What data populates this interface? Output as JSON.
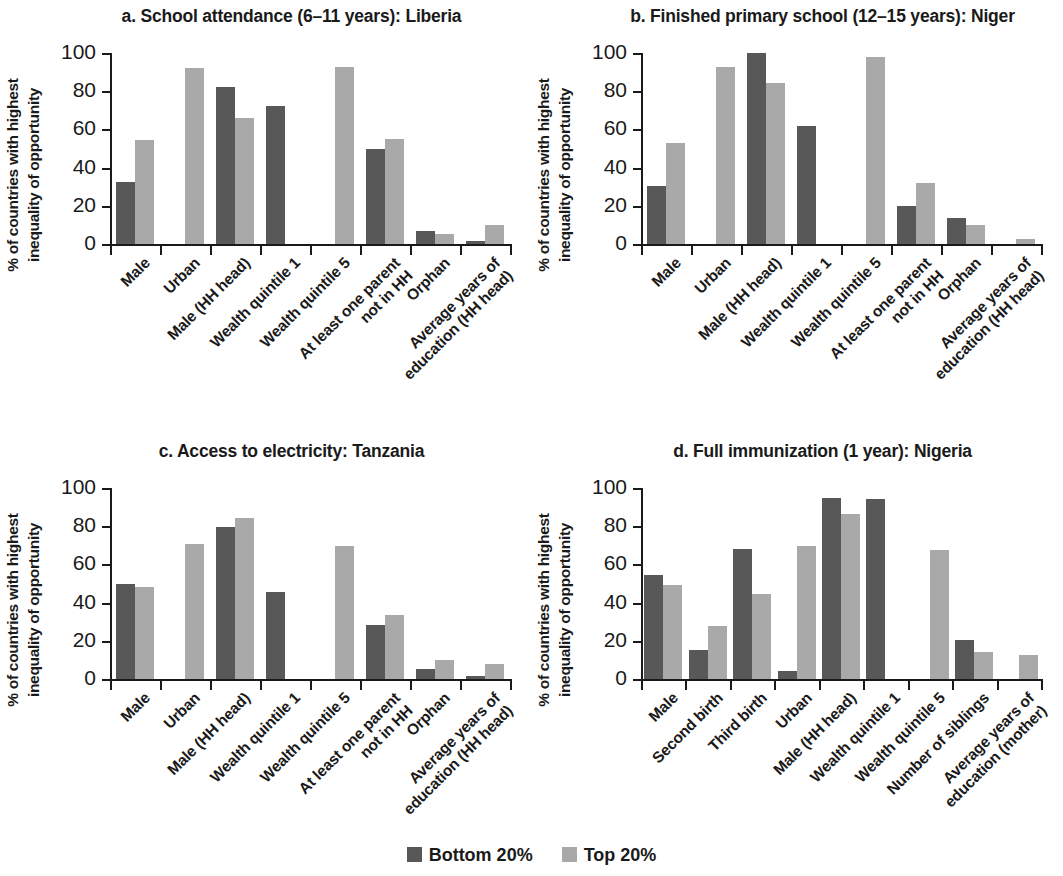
{
  "ylabel": "% of countries with highest inequality of opportunity",
  "ylabel_line1": "% of countries with highest",
  "ylabel_line2": "inequality of opportunity",
  "legend": {
    "bottom_label": "Bottom 20%",
    "top_label": "Top 20%",
    "bottom_color": "#585858",
    "top_color": "#a9a9a9"
  },
  "yticks": [
    "0",
    "20",
    "40",
    "60",
    "80",
    "100"
  ],
  "chart_data": [
    {
      "type": "bar",
      "panel": "a",
      "title": "a. School attendance (6–11 years): Liberia",
      "xlabel": "",
      "ylabel": "% of countries with highest inequality of opportunity",
      "ylim": [
        0,
        100
      ],
      "yticks": [
        0,
        20,
        40,
        60,
        80,
        100
      ],
      "grid": false,
      "legend_position": "bottom-center",
      "categories": [
        "Male",
        "Urban",
        "Male (HH head)",
        "Wealth quintile 1",
        "Wealth quintile 5",
        "At least one parent not in HH",
        "Orphan",
        "Average years of education (HH head)"
      ],
      "series": [
        {
          "name": "Bottom 20%",
          "values": [
            32.5,
            0,
            82,
            72,
            0,
            49.5,
            7,
            1.5
          ]
        },
        {
          "name": "Top 20%",
          "values": [
            54.5,
            92,
            66,
            0,
            92.5,
            55,
            5,
            10
          ]
        }
      ]
    },
    {
      "type": "bar",
      "panel": "b",
      "title": "b. Finished primary school (12–15 years): Niger",
      "xlabel": "",
      "ylabel": "% of countries with highest inequality of opportunity",
      "ylim": [
        0,
        100
      ],
      "yticks": [
        0,
        20,
        40,
        60,
        80,
        100
      ],
      "grid": false,
      "legend_position": "bottom-center",
      "categories": [
        "Male",
        "Urban",
        "Male (HH head)",
        "Wealth quintile 1",
        "Wealth quintile 5",
        "At least one parent not in HH",
        "Orphan",
        "Average years of education (HH head)"
      ],
      "series": [
        {
          "name": "Bottom 20%",
          "values": [
            30.5,
            0,
            100,
            62,
            0,
            20,
            13.5,
            0
          ]
        },
        {
          "name": "Top 20%",
          "values": [
            53,
            92.5,
            84.5,
            0,
            98,
            32,
            10,
            2.5
          ]
        }
      ]
    },
    {
      "type": "bar",
      "panel": "c",
      "title": "c. Access to electricity: Tanzania",
      "xlabel": "",
      "ylabel": "% of countries with highest inequality of opportunity",
      "ylim": [
        0,
        100
      ],
      "yticks": [
        0,
        20,
        40,
        60,
        80,
        100
      ],
      "grid": false,
      "legend_position": "bottom-center",
      "categories": [
        "Male",
        "Urban",
        "Male (HH head)",
        "Wealth quintile 1",
        "Wealth quintile 5",
        "At least one parent not in HH",
        "Orphan",
        "Average years of education (HH head)"
      ],
      "series": [
        {
          "name": "Bottom 20%",
          "values": [
            49.5,
            0,
            79.5,
            45.5,
            0,
            28.5,
            5,
            1.5
          ]
        },
        {
          "name": "Top 20%",
          "values": [
            48,
            70.5,
            84.5,
            0,
            69.5,
            33.5,
            10,
            8
          ]
        }
      ]
    },
    {
      "type": "bar",
      "panel": "d",
      "title": "d. Full immunization (1 year): Nigeria",
      "xlabel": "",
      "ylabel": "% of countries with highest inequality of opportunity",
      "ylim": [
        0,
        100
      ],
      "yticks": [
        0,
        20,
        40,
        60,
        80,
        100
      ],
      "grid": false,
      "legend_position": "bottom-center",
      "categories": [
        "Male",
        "Second birth",
        "Third birth",
        "Urban",
        "Male (HH head)",
        "Wealth quintile 1",
        "Wealth quintile 5",
        "Number of siblings",
        "Average years of education (mother)"
      ],
      "series": [
        {
          "name": "Bottom 20%",
          "values": [
            54.5,
            15,
            68,
            4,
            95,
            94.5,
            0,
            20.5,
            0
          ]
        },
        {
          "name": "Top 20%",
          "values": [
            49,
            28,
            44.5,
            69.5,
            86.5,
            0,
            67.5,
            14,
            12.5
          ]
        }
      ]
    }
  ]
}
